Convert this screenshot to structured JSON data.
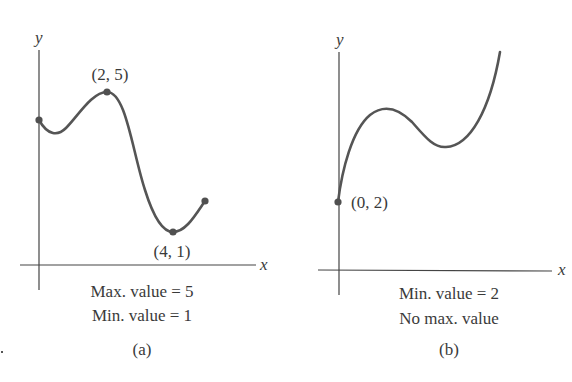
{
  "figures": [
    {
      "id": "a",
      "caption": "(a)",
      "axis_labels": {
        "x": "x",
        "y": "y"
      },
      "point_labels": [
        {
          "label": "(2, 5)",
          "x": 2,
          "y": 5,
          "type": "maximum"
        },
        {
          "label": "(4, 1)",
          "x": 4,
          "y": 1,
          "type": "minimum"
        }
      ],
      "lines": [
        "Max. value = 5",
        "Min. value = 1"
      ]
    },
    {
      "id": "b",
      "caption": "(b)",
      "axis_labels": {
        "x": "x",
        "y": "y"
      },
      "point_labels": [
        {
          "label": "(0, 2)",
          "x": 0,
          "y": 2,
          "type": "minimum"
        }
      ],
      "lines": [
        "Min. value = 2",
        "No max. value"
      ]
    }
  ],
  "colors": {
    "curve": "#555555",
    "axis": "#444444",
    "point": "#505050"
  }
}
